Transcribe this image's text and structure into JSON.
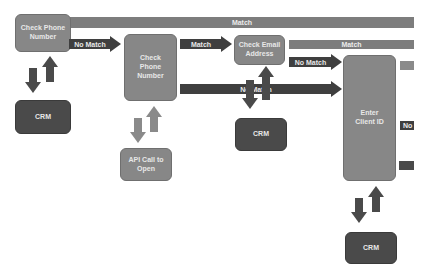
{
  "diagram": {
    "nodes": {
      "check_phone_1": "Check Phone Number",
      "check_phone_2": "Check Phone Number",
      "check_email": "Check Email Address",
      "enter_client_id": "Enter Client ID",
      "crm_1": "CRM",
      "crm_2": "CRM",
      "crm_3": "CRM",
      "api_call": "API Call to Open"
    },
    "edges": {
      "top_match": "Match",
      "no_match_1": "No Match",
      "match_2": "Match",
      "match_3": "Match",
      "no_match_2": "No Match",
      "no_match_long": "No Match",
      "right_stub_no": "No"
    },
    "colors": {
      "light_box": "#878787",
      "dark_box": "#4a4a4a",
      "arrow": "#3f3f3f",
      "bar": "#7d7d7d"
    }
  }
}
